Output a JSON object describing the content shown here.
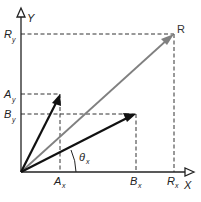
{
  "diagram": {
    "type": "vector-addition",
    "axes": {
      "x_label": "X",
      "y_label": "Y"
    },
    "vectors": [
      {
        "name": "A",
        "label": "",
        "color": "#111111",
        "x_component_label": "A",
        "x_component_sub": "x",
        "y_component_label": "A",
        "y_component_sub": "y"
      },
      {
        "name": "B",
        "label": "",
        "color": "#111111",
        "x_component_label": "B",
        "x_component_sub": "x",
        "y_component_label": "B",
        "y_component_sub": "y"
      },
      {
        "name": "R",
        "label": "R",
        "color": "#808080",
        "x_component_label": "R",
        "x_component_sub": "x",
        "y_component_label": "R",
        "y_component_sub": "y"
      }
    ],
    "angle": {
      "label": "θ",
      "sub": "x"
    },
    "colors": {
      "axes": "#222222",
      "dashed": "#333333",
      "resultant": "#808080",
      "components": "#111111"
    }
  }
}
